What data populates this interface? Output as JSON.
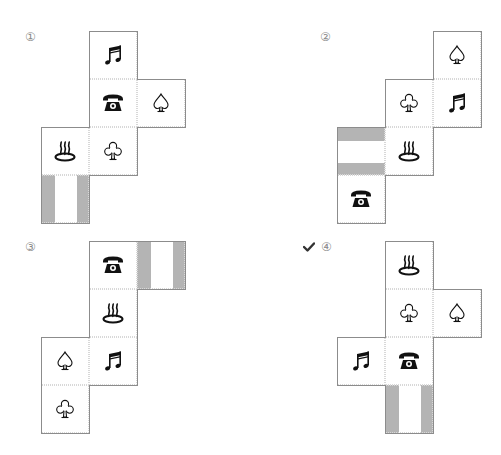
{
  "options": [
    {
      "label": "①",
      "correct": false,
      "cells": [
        {
          "col": 1,
          "row": 0,
          "face": "music"
        },
        {
          "col": 1,
          "row": 1,
          "face": "phone"
        },
        {
          "col": 2,
          "row": 1,
          "face": "spade"
        },
        {
          "col": 0,
          "row": 2,
          "face": "hot-spring"
        },
        {
          "col": 1,
          "row": 2,
          "face": "club"
        },
        {
          "col": 0,
          "row": 3,
          "face": "stripes-vertical"
        }
      ]
    },
    {
      "label": "②",
      "correct": false,
      "cells": [
        {
          "col": 2,
          "row": 0,
          "face": "spade"
        },
        {
          "col": 1,
          "row": 1,
          "face": "club"
        },
        {
          "col": 2,
          "row": 1,
          "face": "music"
        },
        {
          "col": 0,
          "row": 2,
          "face": "stripes-horizontal"
        },
        {
          "col": 1,
          "row": 2,
          "face": "hot-spring"
        },
        {
          "col": 0,
          "row": 3,
          "face": "phone"
        }
      ]
    },
    {
      "label": "③",
      "correct": false,
      "cells": [
        {
          "col": 1,
          "row": 0,
          "face": "phone"
        },
        {
          "col": 2,
          "row": 0,
          "face": "stripes-vertical"
        },
        {
          "col": 1,
          "row": 1,
          "face": "hot-spring"
        },
        {
          "col": 0,
          "row": 2,
          "face": "spade"
        },
        {
          "col": 1,
          "row": 2,
          "face": "music"
        },
        {
          "col": 0,
          "row": 3,
          "face": "club"
        }
      ]
    },
    {
      "label": "④",
      "correct": true,
      "check_mark": "✔",
      "cells": [
        {
          "col": 1,
          "row": 0,
          "face": "hot-spring"
        },
        {
          "col": 1,
          "row": 1,
          "face": "club"
        },
        {
          "col": 2,
          "row": 1,
          "face": "spade"
        },
        {
          "col": 0,
          "row": 2,
          "face": "music"
        },
        {
          "col": 1,
          "row": 2,
          "face": "phone"
        },
        {
          "col": 1,
          "row": 3,
          "face": "stripes-vertical"
        }
      ]
    }
  ],
  "colors": {
    "outline": "#8c8c8c",
    "stripe": "#b4b4b4",
    "label": "#8a8a8a",
    "check": "#333333"
  }
}
